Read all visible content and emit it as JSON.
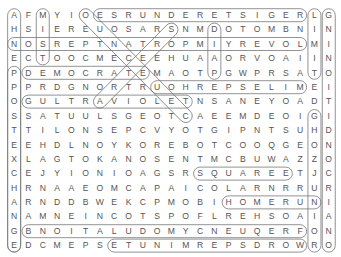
{
  "puzzle": {
    "rows": [
      "AFMYIOESRUNDERETSIGERLG",
      "HSIEREUOSARSNMDOTOMBNIN",
      "NOSREPTNATROPMIYREVOLMI",
      "ECTOOCMECEEHUAAORVOAIIN",
      "PDEMOCRATEMAOTPGWPRSATO",
      "PPRDGNORTRUOHREPSELIMEI",
      "OGULTRAVIOLETNSANEYOADT",
      "SSATUULSGEOTCAEEMDEOIGI",
      "TTILONSEPCVYOTGIPNTSUHD",
      "EEHDLNOYKOREBOTCOOQGEON",
      "XLAGTOKANOSENTMCBUWAZZO",
      "CEJYIONIOAGSRSQUAREETJC",
      "HRNAAEOMCAPAICOLARNRRUR",
      "ARNDDBWEKCPMOBIHOMERUNI",
      "NAMNEINCOTSPOFLREHSOAIA",
      "GBNOITALUDOMYCNEUQERFON",
      "EDCMEPSETUNIMREPSDROWRO"
    ],
    "found_words": [
      "REGISTERED",
      "NUMBERS",
      "LIMIT",
      "GNINOITIDNOC",
      "PORTRAYAL",
      "PRESENT",
      "NOS",
      "DEMOCRATE",
      "REPSELIM",
      "ULTRAVIOLET",
      "SQUARE",
      "HOMERUN",
      "FREQUENCY",
      "MODULATION",
      "WORDSPERMINUTE",
      "ORIGAMI",
      "DOME",
      "EMIT",
      "OVER",
      "NERVE"
    ]
  }
}
